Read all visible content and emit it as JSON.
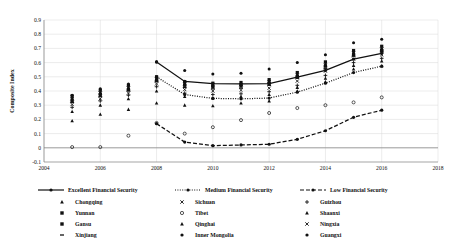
{
  "chart_data": {
    "type": "line",
    "title": "",
    "xlabel": "",
    "ylabel": "Composite Index",
    "xlim": [
      2004,
      2018
    ],
    "ylim": [
      -0.1,
      0.9
    ],
    "xticks": [
      2004,
      2006,
      2008,
      2010,
      2012,
      2014,
      2016,
      2018
    ],
    "yticks": [
      -0.1,
      0,
      0.1,
      0.2,
      0.3,
      0.4,
      0.5,
      0.6,
      0.7,
      0.8,
      0.9
    ],
    "ytick_labels": [
      "-0.1",
      "0",
      "0.1",
      "0.2",
      "0.3",
      "0.4",
      "0.5",
      "0.6",
      "0.7",
      "0.8",
      "0.9"
    ],
    "grid": true,
    "legend_position": "bottom",
    "series": [
      {
        "name": "Excellent Financial Security",
        "style": "solid",
        "marker": "filled-circle",
        "x": [
          2008,
          2009,
          2010,
          2011,
          2012,
          2013,
          2014,
          2015,
          2016
        ],
        "values": [
          0.605,
          0.467,
          0.452,
          0.45,
          0.452,
          0.497,
          0.545,
          0.625,
          0.665
        ]
      },
      {
        "name": "Medium Financial Security",
        "style": "dotted",
        "marker": "filled-circle",
        "x": [
          2008,
          2009,
          2010,
          2011,
          2012,
          2013,
          2014,
          2015,
          2016
        ],
        "values": [
          0.5,
          0.375,
          0.348,
          0.345,
          0.35,
          0.392,
          0.455,
          0.53,
          0.575
        ]
      },
      {
        "name": "Low Financial Security",
        "style": "dashed",
        "marker": "filled-circle",
        "x": [
          2008,
          2009,
          2010,
          2011,
          2012,
          2013,
          2014,
          2015,
          2016
        ],
        "values": [
          0.17,
          0.04,
          0.015,
          0.02,
          0.025,
          0.06,
          0.12,
          0.215,
          0.265
        ]
      }
    ],
    "scatter": [
      {
        "name": "Chongqing",
        "marker": "triangle",
        "x": [
          2005,
          2006,
          2007,
          2008,
          2009,
          2010,
          2011,
          2012,
          2013,
          2014,
          2015,
          2016
        ],
        "values": [
          0.19,
          0.235,
          0.27,
          0.315,
          0.3,
          0.295,
          0.315,
          0.33,
          0.4,
          0.465,
          0.555,
          0.575
        ]
      },
      {
        "name": "Sichuan",
        "marker": "cross",
        "x": [
          2005,
          2006,
          2007,
          2008,
          2009,
          2010,
          2011,
          2012,
          2013,
          2014,
          2015,
          2016
        ],
        "values": [
          0.305,
          0.345,
          0.385,
          0.45,
          0.41,
          0.4,
          0.405,
          0.42,
          0.47,
          0.54,
          0.625,
          0.655
        ]
      },
      {
        "name": "Guizhou",
        "marker": "plus",
        "x": [
          2005,
          2006,
          2007,
          2008,
          2009,
          2010,
          2011,
          2012,
          2013,
          2014,
          2015,
          2016
        ],
        "values": [
          0.285,
          0.33,
          0.37,
          0.43,
          0.385,
          0.375,
          0.38,
          0.395,
          0.44,
          0.51,
          0.6,
          0.63
        ]
      },
      {
        "name": "Yunnan",
        "marker": "filled-square",
        "x": [
          2005,
          2006,
          2007,
          2008,
          2009,
          2010,
          2011,
          2012,
          2013,
          2014,
          2015,
          2016
        ],
        "values": [
          0.33,
          0.375,
          0.41,
          0.475,
          0.44,
          0.43,
          0.435,
          0.455,
          0.5,
          0.575,
          0.655,
          0.685
        ]
      },
      {
        "name": "Tibet",
        "marker": "open-circle",
        "x": [
          2005,
          2006,
          2007,
          2008,
          2009,
          2010,
          2011,
          2012,
          2013,
          2014,
          2015,
          2016
        ],
        "values": [
          0.005,
          0.005,
          0.085,
          0.175,
          0.1,
          0.145,
          0.195,
          0.245,
          0.28,
          0.3,
          0.32,
          0.355
        ]
      },
      {
        "name": "Shaanxi",
        "marker": "triangle",
        "x": [
          2005,
          2006,
          2007,
          2008,
          2009,
          2010,
          2011,
          2012,
          2013,
          2014,
          2015,
          2016
        ],
        "values": [
          0.355,
          0.39,
          0.425,
          0.49,
          0.455,
          0.445,
          0.45,
          0.47,
          0.515,
          0.59,
          0.67,
          0.7
        ]
      },
      {
        "name": "Gansu",
        "marker": "filled-square",
        "x": [
          2005,
          2006,
          2007,
          2008,
          2009,
          2010,
          2011,
          2012,
          2013,
          2014,
          2015,
          2016
        ],
        "values": [
          0.365,
          0.405,
          0.44,
          0.5,
          0.465,
          0.455,
          0.46,
          0.48,
          0.53,
          0.605,
          0.685,
          0.715
        ]
      },
      {
        "name": "Qinghai",
        "marker": "triangle",
        "x": [
          2005,
          2006,
          2007,
          2008,
          2009,
          2010,
          2011,
          2012,
          2013,
          2014,
          2015,
          2016
        ],
        "values": [
          0.255,
          0.3,
          0.345,
          0.4,
          0.36,
          0.35,
          0.36,
          0.375,
          0.425,
          0.49,
          0.58,
          0.61
        ]
      },
      {
        "name": "Ningxia",
        "marker": "cross",
        "x": [
          2005,
          2006,
          2007,
          2008,
          2009,
          2010,
          2011,
          2012,
          2013,
          2014,
          2015,
          2016
        ],
        "values": [
          0.345,
          0.385,
          0.42,
          0.485,
          0.45,
          0.44,
          0.445,
          0.465,
          0.51,
          0.585,
          0.665,
          0.695
        ]
      },
      {
        "name": "Xinjiang",
        "marker": "dash",
        "x": [
          2005,
          2006,
          2007,
          2008,
          2009,
          2010,
          2011,
          2012,
          2013,
          2014,
          2015,
          2016
        ],
        "values": [
          0.32,
          0.36,
          0.4,
          0.465,
          0.425,
          0.415,
          0.42,
          0.44,
          0.49,
          0.56,
          0.645,
          0.675
        ]
      },
      {
        "name": "Inner Mongolia",
        "marker": "filled-circle",
        "x": [
          2005,
          2006,
          2007,
          2008,
          2009,
          2010,
          2011,
          2012,
          2013,
          2014,
          2015,
          2016
        ],
        "values": [
          0.37,
          0.415,
          0.45,
          0.605,
          0.545,
          0.52,
          0.525,
          0.555,
          0.6,
          0.655,
          0.74,
          0.765
        ]
      },
      {
        "name": "Guangxi",
        "marker": "filled-circle",
        "x": [
          2005,
          2006,
          2007,
          2008,
          2009,
          2010,
          2011,
          2012,
          2013,
          2014,
          2015,
          2016
        ],
        "values": [
          0.34,
          0.38,
          0.415,
          0.48,
          0.445,
          0.435,
          0.44,
          0.46,
          0.505,
          0.58,
          0.66,
          0.69
        ]
      }
    ]
  },
  "legend": {
    "series_row": [
      {
        "label": "Excellent Financial Security",
        "style": "solid",
        "marker": "filled-circle"
      },
      {
        "label": "Medium Financial Security",
        "style": "dotted",
        "marker": "filled-circle"
      },
      {
        "label": "Low Financial Security",
        "style": "dashed",
        "marker": "filled-circle"
      }
    ],
    "columns": [
      [
        {
          "label": "Chongqing",
          "marker": "triangle"
        },
        {
          "label": "Yunnan",
          "marker": "filled-square"
        },
        {
          "label": "Gansu",
          "marker": "filled-square"
        },
        {
          "label": "Xinjiang",
          "marker": "dash"
        }
      ],
      [
        {
          "label": "Sichuan",
          "marker": "cross"
        },
        {
          "label": "Tibet",
          "marker": "open-circle"
        },
        {
          "label": "Qinghai",
          "marker": "triangle"
        },
        {
          "label": "Inner Mongolia",
          "marker": "filled-circle"
        }
      ],
      [
        {
          "label": "Guizhou",
          "marker": "plus"
        },
        {
          "label": "Shaanxi",
          "marker": "triangle"
        },
        {
          "label": "Ningxia",
          "marker": "cross"
        },
        {
          "label": "Guangxi",
          "marker": "filled-circle"
        }
      ]
    ]
  },
  "colors": {
    "ink": "#111111",
    "grid": "#d9d9d9",
    "axis": "#7f7f7f",
    "background": "#ffffff"
  }
}
